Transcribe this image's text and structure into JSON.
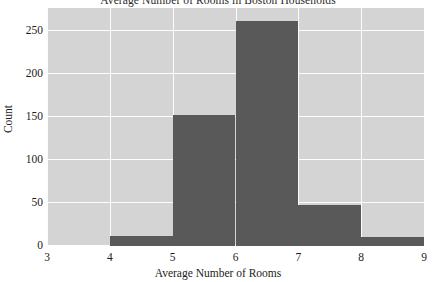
{
  "chart_data": {
    "type": "bar",
    "title": "Average Number of  Rooms in Boston Households",
    "xlabel": "Average Number of  Rooms",
    "ylabel": "Count",
    "categories": [
      "3-4",
      "4-5",
      "5-6",
      "6-7",
      "7-8",
      "8-9"
    ],
    "bin_edges": [
      3,
      4,
      5,
      6,
      7,
      8,
      9
    ],
    "values": [
      0,
      12,
      153,
      262,
      48,
      10
    ],
    "xlim": [
      3,
      9
    ],
    "ylim": [
      0,
      277
    ],
    "xticks": [
      "3",
      "4",
      "5",
      "6",
      "7",
      "8",
      "9"
    ],
    "xtick_values": [
      3,
      4,
      5,
      6,
      7,
      8,
      9
    ],
    "yticks": [
      "0",
      "50",
      "100",
      "150",
      "200",
      "250"
    ],
    "ytick_values": [
      0,
      50,
      100,
      150,
      200,
      250
    ],
    "grid": true,
    "legend": false,
    "colors": {
      "bar": "#595959",
      "panel": "#d4d4d4",
      "gridline": "#fdfdfd",
      "background": "#ffffff",
      "text": "#1c1c1c"
    }
  }
}
